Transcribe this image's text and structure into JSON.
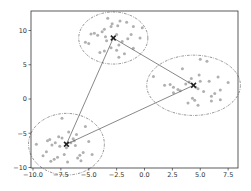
{
  "chart_data": {
    "type": "scatter",
    "title": "",
    "xlabel": "",
    "ylabel": "",
    "xlim": [
      -10.2,
      8.2
    ],
    "ylim": [
      -10.2,
      12.7
    ],
    "grid": false,
    "legend": null,
    "x_ticks": [
      -10.0,
      -7.5,
      -5.0,
      -2.5,
      0.0,
      2.5,
      5.0,
      7.5
    ],
    "x_tick_labels": [
      "−10.0",
      "−7.5",
      "−5.0",
      "−2.5",
      "0.0",
      "2.5",
      "5.0",
      "7.5"
    ],
    "y_ticks": [
      -10,
      -5,
      0,
      5,
      10
    ],
    "y_tick_labels": [
      "−10",
      "−5",
      "0",
      "5",
      "10"
    ],
    "point_color": "#b0b0b0",
    "centroid_color": "#222222",
    "line_color": "#555555",
    "circle_color": "#666666",
    "clusters": [
      {
        "name": "cluster-top",
        "centroid": [
          -2.8,
          8.9
        ],
        "radius_x": 3.1,
        "radius_y": 3.8,
        "points": [
          [
            -4.5,
            9.6
          ],
          [
            -4.2,
            9.3
          ],
          [
            -4.8,
            9.5
          ],
          [
            -3.6,
            10.2
          ],
          [
            -3.3,
            11.8
          ],
          [
            -2.2,
            11.4
          ],
          [
            -1.6,
            11.2
          ],
          [
            -1.0,
            10.6
          ],
          [
            -2.4,
            10.7
          ],
          [
            -2.9,
            11.0
          ],
          [
            -3.0,
            10.6
          ],
          [
            -1.2,
            9.4
          ],
          [
            -0.2,
            10.4
          ],
          [
            -0.4,
            8.9
          ],
          [
            -1.0,
            7.4
          ],
          [
            -1.8,
            6.6
          ],
          [
            -2.3,
            6.1
          ],
          [
            -2.5,
            7.1
          ],
          [
            -3.0,
            7.5
          ],
          [
            -3.6,
            7.0
          ],
          [
            -4.0,
            6.8
          ],
          [
            -5.0,
            8.1
          ],
          [
            -5.3,
            8.3
          ],
          [
            -3.4,
            8.5
          ],
          [
            -3.5,
            9.1
          ],
          [
            -2.5,
            9.4
          ],
          [
            -2.0,
            8.4
          ],
          [
            -3.8,
            9.8
          ],
          [
            -2.3,
            7.9
          ],
          [
            -1.5,
            8.8
          ]
        ]
      },
      {
        "name": "cluster-right",
        "centroid": [
          4.4,
          2.0
        ],
        "radius_x": 4.2,
        "radius_y": 4.4,
        "points": [
          [
            0.8,
            3.3
          ],
          [
            1.8,
            2.0
          ],
          [
            2.3,
            2.1
          ],
          [
            2.6,
            1.7
          ],
          [
            3.0,
            1.4
          ],
          [
            3.4,
            4.4
          ],
          [
            3.2,
            1.2
          ],
          [
            3.7,
            2.2
          ],
          [
            4.0,
            2.5
          ],
          [
            4.3,
            0.1
          ],
          [
            4.5,
            -0.2
          ],
          [
            4.8,
            -0.9
          ],
          [
            4.8,
            1.5
          ],
          [
            4.9,
            3.5
          ],
          [
            5.0,
            2.6
          ],
          [
            5.0,
            5.8
          ],
          [
            5.6,
            5.5
          ],
          [
            5.8,
            2.6
          ],
          [
            6.0,
            0.4
          ],
          [
            6.0,
            -0.3
          ],
          [
            6.6,
            3.2
          ],
          [
            6.8,
            1.3
          ],
          [
            6.8,
            -0.1
          ],
          [
            7.5,
            2.4
          ],
          [
            4.6,
            1.7
          ],
          [
            4.2,
            3.0
          ],
          [
            2.6,
            0.9
          ],
          [
            5.3,
            1.1
          ],
          [
            3.9,
            -0.6
          ],
          [
            6.3,
            0.8
          ]
        ]
      },
      {
        "name": "cluster-bottom-left",
        "centroid": [
          -7.0,
          -6.6
        ],
        "radius_x": 3.4,
        "radius_y": 4.5,
        "points": [
          [
            -9.7,
            -6.6
          ],
          [
            -9.1,
            -8.3
          ],
          [
            -8.7,
            -6.1
          ],
          [
            -8.5,
            -5.9
          ],
          [
            -8.3,
            -6.7
          ],
          [
            -8.1,
            -8.8
          ],
          [
            -8.0,
            -6.4
          ],
          [
            -7.7,
            -5.5
          ],
          [
            -7.4,
            -2.8
          ],
          [
            -7.4,
            -5.7
          ],
          [
            -7.2,
            -8.1
          ],
          [
            -7.0,
            -7.1
          ],
          [
            -6.8,
            -4.8
          ],
          [
            -6.6,
            -6.4
          ],
          [
            -6.4,
            -5.8
          ],
          [
            -6.3,
            -6.1
          ],
          [
            -6.2,
            -6.8
          ],
          [
            -6.0,
            -8.6
          ],
          [
            -5.8,
            -8.2
          ],
          [
            -5.5,
            -7.8
          ],
          [
            -5.3,
            -4.0
          ],
          [
            -5.0,
            -6.2
          ],
          [
            -4.7,
            -8.1
          ],
          [
            -5.7,
            -9.0
          ],
          [
            -7.8,
            -8.5
          ],
          [
            -8.8,
            -7.7
          ],
          [
            -6.1,
            -5.2
          ],
          [
            -7.6,
            -6.9
          ],
          [
            -6.9,
            -9.2
          ],
          [
            -8.4,
            -9.1
          ]
        ]
      }
    ],
    "connections": [
      [
        0,
        1
      ],
      [
        0,
        2
      ],
      [
        2,
        1
      ]
    ]
  }
}
